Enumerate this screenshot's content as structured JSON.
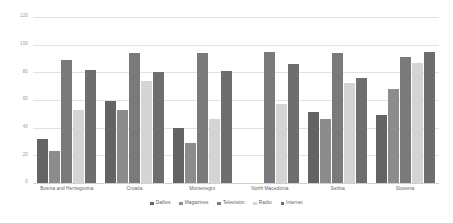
{
  "chart_data": {
    "type": "bar",
    "title": "",
    "subtitle": "",
    "xlabel": "",
    "ylabel": "",
    "ylim": [
      0,
      120
    ],
    "ytick_labels": [
      "120",
      "100",
      "80",
      "60",
      "40",
      "20",
      "0"
    ],
    "ytick_values": [
      120,
      100,
      80,
      60,
      40,
      20,
      0
    ],
    "grid": true,
    "legend_position": "bottom",
    "categories": [
      "Bosnia and Herzegovina",
      "Croatia",
      "Montenegro",
      "North Macedonia",
      "Serbia",
      "Slovenia"
    ],
    "series": [
      {
        "name": "Dailies",
        "color": "#646464",
        "values": [
          32,
          59,
          40,
          null,
          51,
          49
        ]
      },
      {
        "name": "Magazines",
        "color": "#8c8c8c",
        "values": [
          23,
          53,
          29,
          null,
          46,
          68
        ]
      },
      {
        "name": "Television",
        "color": "#7a7a7a",
        "values": [
          89,
          94,
          94,
          95,
          94,
          91
        ]
      },
      {
        "name": "Radio",
        "color": "#d4d4d4",
        "values": [
          53,
          74,
          46,
          57,
          72,
          87
        ]
      },
      {
        "name": "Internet",
        "color": "#6e6e6e",
        "values": [
          82,
          80,
          81,
          86,
          76,
          95
        ]
      }
    ]
  },
  "legend": {
    "items": [
      {
        "label": "Dailies",
        "color": "#646464"
      },
      {
        "label": "Magazines",
        "color": "#8c8c8c"
      },
      {
        "label": "Television",
        "color": "#7a7a7a"
      },
      {
        "label": "Radio",
        "color": "#d4d4d4"
      },
      {
        "label": "Internet",
        "color": "#6e6e6e"
      }
    ]
  }
}
